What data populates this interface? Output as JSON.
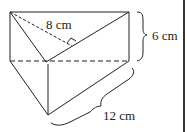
{
  "figure": {
    "type": "triangular-prism",
    "labels": {
      "triangle_height": "8 cm",
      "prism_height": "6 cm",
      "prism_length": "12 cm"
    },
    "colors": {
      "stroke": "#222222",
      "background": "#ffffff"
    }
  }
}
